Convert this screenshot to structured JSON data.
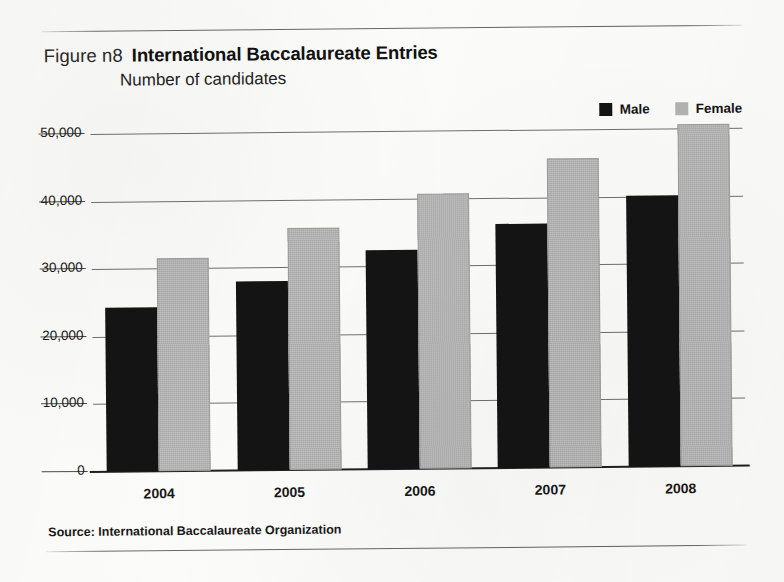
{
  "figure": {
    "label": "Figure n8",
    "title": "International Baccalaureate Entries",
    "subtitle": "Number of candidates",
    "source": "Source: International Baccalaureate Organization"
  },
  "legend": {
    "items": [
      {
        "label": "Male",
        "color": "#141414"
      },
      {
        "label": "Female",
        "color": "#b3b3b3"
      }
    ]
  },
  "axis": {
    "yticks": [
      "0",
      "10,000",
      "20,000",
      "30,000",
      "40,000",
      "50,000"
    ],
    "xticks": [
      "2004",
      "2005",
      "2006",
      "2007",
      "2008"
    ]
  },
  "chart_data": {
    "type": "bar",
    "title": "International Baccalaureate Entries",
    "subtitle": "Number of candidates",
    "xlabel": "",
    "ylabel": "Number of candidates",
    "categories": [
      "2004",
      "2005",
      "2006",
      "2007",
      "2008"
    ],
    "series": [
      {
        "name": "Male",
        "color": "#141414",
        "values": [
          24300,
          27900,
          32400,
          36100,
          40100
        ]
      },
      {
        "name": "Female",
        "color": "#b3b3b3",
        "values": [
          31500,
          35800,
          40700,
          45700,
          50600
        ]
      }
    ],
    "ylim": [
      0,
      50000
    ],
    "ytick_values": [
      0,
      10000,
      20000,
      30000,
      40000,
      50000
    ],
    "ytick_labels": [
      "0",
      "10,000",
      "20,000",
      "30,000",
      "40,000",
      "50,000"
    ],
    "grid": true,
    "legend_position": "top-right",
    "source": "Source: International Baccalaureate Organization"
  }
}
